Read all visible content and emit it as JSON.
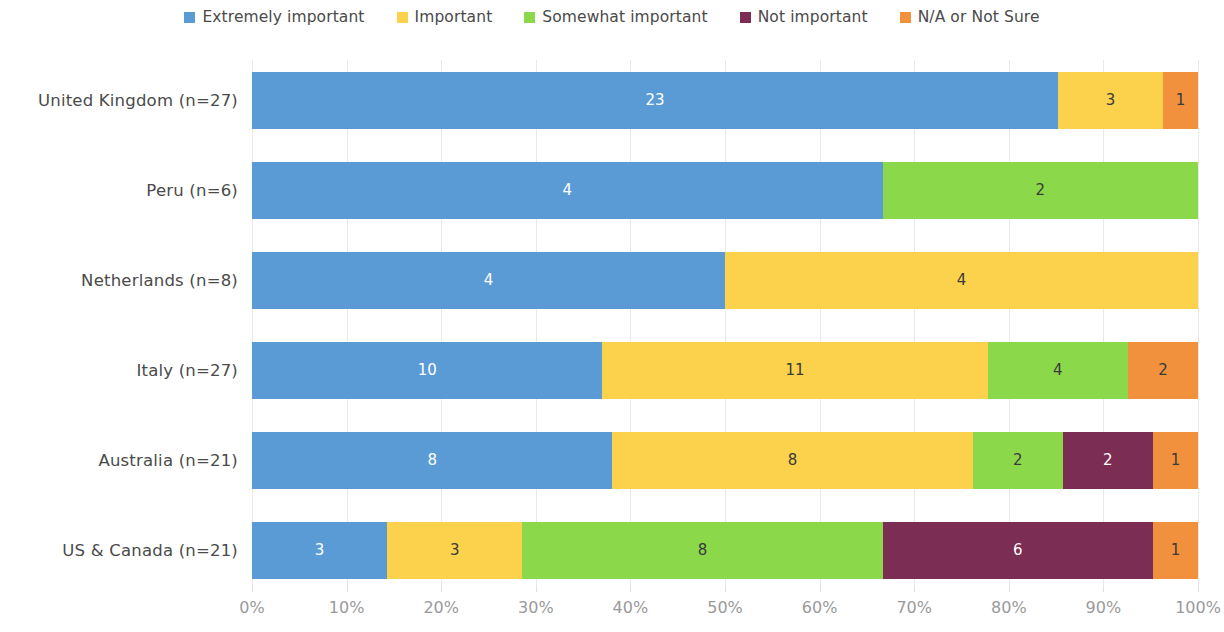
{
  "legend": {
    "position": "top-center",
    "items": [
      {
        "label": "Extremely important",
        "color": "#5B9BD5"
      },
      {
        "label": "Important",
        "color": "#FCD24C"
      },
      {
        "label": "Somewhat important",
        "color": "#8BD94A"
      },
      {
        "label": "Not important",
        "color": "#7B2D54"
      },
      {
        "label": "N/A or Not Sure",
        "color": "#F2913D"
      }
    ]
  },
  "axis": {
    "x_ticks": [
      "0%",
      "10%",
      "20%",
      "30%",
      "40%",
      "50%",
      "60%",
      "70%",
      "80%",
      "90%",
      "100%"
    ],
    "y_labels": [
      "United Kingdom (n=27)",
      "Peru (n=6)",
      "Netherlands (n=8)",
      "Italy (n=27)",
      "Australia (n=21)",
      "US & Canada (n=21)"
    ]
  },
  "chart_data": {
    "type": "bar",
    "orientation": "horizontal",
    "stacked": true,
    "normalized": true,
    "title": "",
    "xlabel": "",
    "ylabel": "",
    "xlim": [
      0,
      100
    ],
    "grid": true,
    "legend_position": "top-center",
    "categories": [
      "United Kingdom (n=27)",
      "Peru (n=6)",
      "Netherlands (n=8)",
      "Italy (n=27)",
      "Australia (n=21)",
      "US & Canada (n=21)"
    ],
    "totals": [
      27,
      6,
      8,
      27,
      21,
      21
    ],
    "series": [
      {
        "name": "Extremely important",
        "color": "#5B9BD5",
        "values": [
          23,
          4,
          4,
          10,
          8,
          3
        ]
      },
      {
        "name": "Important",
        "color": "#FCD24C",
        "values": [
          3,
          0,
          4,
          11,
          8,
          3
        ]
      },
      {
        "name": "Somewhat important",
        "color": "#8BD94A",
        "values": [
          0,
          2,
          0,
          4,
          2,
          8
        ]
      },
      {
        "name": "Not important",
        "color": "#7B2D54",
        "values": [
          0,
          0,
          0,
          0,
          2,
          6
        ]
      },
      {
        "name": "N/A or Not Sure",
        "color": "#F2913D",
        "values": [
          1,
          0,
          0,
          2,
          1,
          1
        ]
      }
    ]
  }
}
